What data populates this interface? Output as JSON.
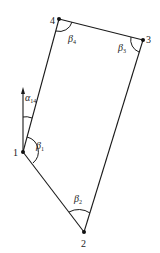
{
  "diagram": {
    "type": "traverse-polygon",
    "points": [
      {
        "id": "1",
        "label": "1",
        "x": 23,
        "y": 152
      },
      {
        "id": "2",
        "label": "2",
        "x": 84,
        "y": 232
      },
      {
        "id": "3",
        "label": "3",
        "x": 143,
        "y": 40
      },
      {
        "id": "4",
        "label": "4",
        "x": 59,
        "y": 19
      }
    ],
    "edges": [
      [
        "1",
        "2"
      ],
      [
        "2",
        "3"
      ],
      [
        "3",
        "4"
      ],
      [
        "4",
        "1"
      ]
    ],
    "angles": [
      {
        "vertex": "1",
        "symbol": "β",
        "subscript": "1"
      },
      {
        "vertex": "2",
        "symbol": "β",
        "subscript": "2"
      },
      {
        "vertex": "3",
        "symbol": "β",
        "subscript": "3"
      },
      {
        "vertex": "4",
        "symbol": "β",
        "subscript": "4"
      }
    ],
    "azimuth": {
      "symbol": "α",
      "subscript": "14",
      "direction": "north",
      "from_vertex": "1"
    },
    "colors": {
      "line": "#1a1a1a",
      "point": "#111111",
      "background": "#ffffff"
    }
  }
}
